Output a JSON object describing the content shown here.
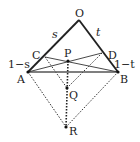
{
  "figure": {
    "points": {
      "O": {
        "label": "O",
        "x": 79,
        "y": 20
      },
      "A": {
        "label": "A",
        "x": 28,
        "y": 72
      },
      "B": {
        "label": "B",
        "x": 118,
        "y": 72
      },
      "C": {
        "label": "C",
        "x": 45,
        "y": 57
      },
      "D": {
        "label": "D",
        "x": 102,
        "y": 53
      },
      "P": {
        "label": "P",
        "x": 68,
        "y": 61
      },
      "Q": {
        "label": "Q",
        "x": 67,
        "y": 88
      },
      "R": {
        "label": "R",
        "x": 66,
        "y": 127
      }
    },
    "segment_labels": {
      "s": "s",
      "t": "t",
      "one_minus_s": "1−s",
      "one_minus_t": "1−t"
    },
    "colors": {
      "stroke": "#222222",
      "base": "#555555"
    }
  }
}
